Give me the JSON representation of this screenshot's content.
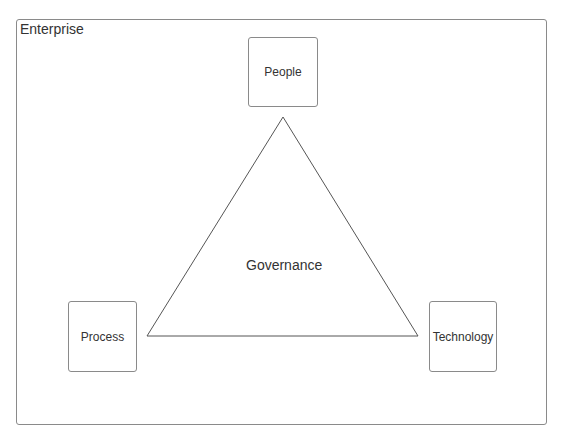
{
  "diagram": {
    "container": {
      "label": "Enterprise"
    },
    "center": {
      "label": "Governance",
      "shape": "triangle"
    },
    "nodes": [
      {
        "id": "people",
        "label": "People"
      },
      {
        "id": "process",
        "label": "Process"
      },
      {
        "id": "technology",
        "label": "Technology"
      }
    ],
    "colors": {
      "stroke": "#8a8a8a",
      "text": "#333333",
      "background": "#ffffff"
    }
  }
}
